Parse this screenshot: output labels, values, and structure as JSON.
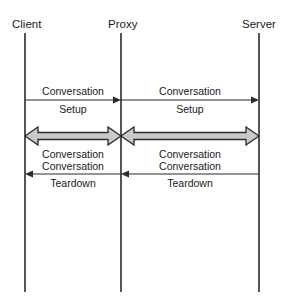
{
  "diagram": {
    "type": "sequence-diagram",
    "background_color": "#ffffff",
    "line_color": "#2b2b2b",
    "block_arrow_fill": "#c9c9c9",
    "lifelines": [
      {
        "id": "client",
        "label": "Client",
        "x": 25
      },
      {
        "id": "proxy",
        "label": "Proxy",
        "x": 121
      },
      {
        "id": "server",
        "label": "Server",
        "x": 259
      }
    ],
    "messages": [
      {
        "id": "setup-client-proxy",
        "line1": "Conversation",
        "line2": "Setup",
        "from": "client",
        "to": "proxy",
        "direction": "right",
        "style": "thin"
      },
      {
        "id": "setup-proxy-server",
        "line1": "Conversation",
        "line2": "Setup",
        "from": "proxy",
        "to": "server",
        "direction": "right",
        "style": "thin"
      },
      {
        "id": "conversation-client-proxy",
        "line1": "Conversation",
        "from": "client",
        "to": "proxy",
        "direction": "both",
        "style": "block"
      },
      {
        "id": "conversation-proxy-server",
        "line1": "Conversation",
        "from": "proxy",
        "to": "server",
        "direction": "both",
        "style": "block"
      },
      {
        "id": "teardown-proxy-client",
        "line1": "Conversation",
        "line2": "Teardown",
        "from": "proxy",
        "to": "client",
        "direction": "left",
        "style": "thin"
      },
      {
        "id": "teardown-server-proxy",
        "line1": "Conversation",
        "line2": "Teardown",
        "from": "server",
        "to": "proxy",
        "direction": "left",
        "style": "thin"
      }
    ]
  }
}
